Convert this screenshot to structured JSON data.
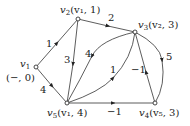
{
  "diagram": {
    "type": "directed-weighted-graph",
    "nodes": [
      {
        "id": "v1",
        "label": "v",
        "sub": "1",
        "annotation": "(−, 0)",
        "x": 36,
        "y": 67
      },
      {
        "id": "v2",
        "label": "v",
        "sub": "2",
        "annotation": "(v₁, 1)",
        "x": 78,
        "y": 19
      },
      {
        "id": "v3",
        "label": "v",
        "sub": "3",
        "annotation": "(v₂, 3)",
        "x": 135,
        "y": 32
      },
      {
        "id": "v4",
        "label": "v",
        "sub": "4",
        "annotation": "(v₅, 3)",
        "x": 155,
        "y": 103
      },
      {
        "id": "v5",
        "label": "v",
        "sub": "5",
        "annotation": "(v₁, 4)",
        "x": 67,
        "y": 103
      }
    ],
    "edges": [
      {
        "from": "v1",
        "to": "v2",
        "weight": "1"
      },
      {
        "from": "v1",
        "to": "v5",
        "weight": "4"
      },
      {
        "from": "v2",
        "to": "v3",
        "weight": "2"
      },
      {
        "from": "v2",
        "to": "v5",
        "weight": "3"
      },
      {
        "from": "v3",
        "to": "v5",
        "weight": "4"
      },
      {
        "from": "v5",
        "to": "v3",
        "weight": "1"
      },
      {
        "from": "v3",
        "to": "v4",
        "weight": "5"
      },
      {
        "from": "v4",
        "to": "v3",
        "weight": "−1"
      },
      {
        "from": "v5",
        "to": "v4",
        "weight": "−1"
      }
    ]
  }
}
